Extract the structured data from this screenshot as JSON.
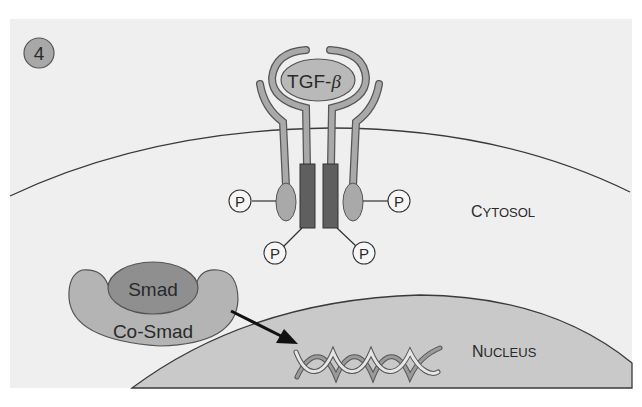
{
  "figure": {
    "step_number": "4",
    "ligand_label": "TGF-",
    "ligand_greek": "β",
    "phosphate_label": "P",
    "cytosol_label_initial": "C",
    "cytosol_label_rest": "YTOSOL",
    "nucleus_label_initial": "N",
    "nucleus_label_rest": "UCLEUS",
    "smad_label": "Smad",
    "cosmad_label": "Co-Smad",
    "dna_icon": "dna-double-helix"
  },
  "colors": {
    "panel_bg": "#efefef",
    "page_bg": "#ffffff",
    "membrane_line": "#3a3a3a",
    "nucleus_fill": "#c9c9c9",
    "receptor_arm": "#a9a9a9",
    "receptor_kinase": "#5f5f5f",
    "ligand_fill": "#b9b9b9",
    "smad_fill": "#8f8f8f",
    "cosmad_fill": "#b4b4b4",
    "step_badge": "#a8a8a8",
    "arrow": "#111111"
  }
}
